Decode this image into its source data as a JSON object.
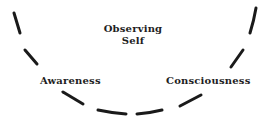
{
  "diagram": {
    "labels": {
      "center_line1": "Observing",
      "center_line2": "Self",
      "left": "Awareness",
      "right": "Consciousness"
    },
    "arc": {
      "style": "dashed",
      "color": "#1a1a1a",
      "shape": "U-shaped curve"
    }
  }
}
